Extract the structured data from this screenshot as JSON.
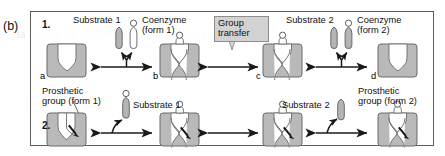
{
  "figure": {
    "panel_label": "(b)",
    "rows": [
      {
        "number": "1."
      },
      {
        "number": "2."
      }
    ],
    "group_transfer_callout": {
      "line1": "Group",
      "line2": "transfer"
    },
    "row1": {
      "node_letters": [
        "a",
        "b",
        "c",
        "d"
      ],
      "left_reactants": {
        "substrate": "Substrate 1",
        "coenzyme_line1": "Coenzyme",
        "coenzyme_line2": "(form 1)"
      },
      "right_reactants": {
        "substrate": "Substrate 2",
        "coenzyme_line1": "Coenzyme",
        "coenzyme_line2": "(form 2)"
      }
    },
    "row2": {
      "left_label_line1": "Prosthetic",
      "left_label_line2": "group (form 1)",
      "right_label_line1": "Prosthetic",
      "right_label_line2": "group (form 2)",
      "substrate_left": "Substrate 1",
      "substrate_right": "Substrate 2"
    },
    "colors": {
      "enzyme_fill": "#b9b9b9",
      "enzyme_stroke": "#6b6b6b",
      "site_fill": "#ffffff",
      "ligand_fill": "#b4b4b4",
      "ligand_stroke": "#5e5e5e",
      "arrow": "#1a1a1a",
      "callout_fill": "#d2d2d2",
      "frame": "#5d5d5d"
    }
  },
  "background_text": {
    "l1": "   ta hairah an ta nartisinata in a chamical raartinn",
    "l2": "   tha anzuma a nrnthatir arniin in a tranennrt nrntain",
    "l3": "   mnlarilar in tha ranrtinn  Tha rnanzuma ia hnind",
    "l4": "   ranzumaa ara drivad frnm vitamina  thaaa aimnla",
    "l5": "   a rnanzuma  If thay ara firmly hnind tn tha nrntain",
    "l6": "   nrnthatir arniin  In thia raaa tha rnmnlav nf tha",
    "l7": "   nrntain and ita hnind rnanzuma ia rallad a hnlnanzuma"
  }
}
